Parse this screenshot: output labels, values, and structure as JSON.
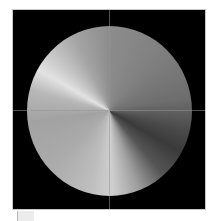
{
  "canvas": {
    "background": "#000000",
    "border_color": "#c8c8c8",
    "shape": "circle",
    "fill": "conic-gradient-grayscale",
    "crosshair": {
      "visible": true,
      "color": "#969696"
    }
  },
  "gradient_stops": [
    {
      "angle": 0,
      "color": "#8c8c8c"
    },
    {
      "angle": 90,
      "color": "#6e6e6e"
    },
    {
      "angle": 120,
      "color": "#3a3a3a"
    },
    {
      "angle": 178,
      "color": "#cfcfcf"
    },
    {
      "angle": 262,
      "color": "#a2a2a2"
    },
    {
      "angle": 300,
      "color": "#e2e2e2"
    },
    {
      "angle": 360,
      "color": "#8c8c8c"
    }
  ]
}
